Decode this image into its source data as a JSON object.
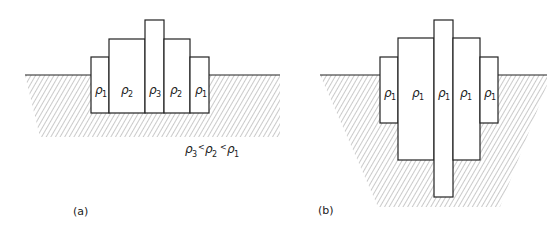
{
  "figure": {
    "panels": [
      {
        "caption": "(a)",
        "blocks": [
          {
            "symbol": "ρ",
            "subscript": "1"
          },
          {
            "symbol": "ρ",
            "subscript": "2"
          },
          {
            "symbol": "ρ",
            "subscript": "3"
          },
          {
            "symbol": "ρ",
            "subscript": "2"
          },
          {
            "symbol": "ρ",
            "subscript": "1"
          }
        ],
        "relation": {
          "parts": [
            {
              "symbol": "ρ",
              "subscript": "3"
            },
            {
              "op": "<"
            },
            {
              "symbol": "ρ",
              "subscript": "2"
            },
            {
              "op": "<"
            },
            {
              "symbol": "ρ",
              "subscript": "1"
            }
          ]
        }
      },
      {
        "caption": "(b)",
        "blocks": [
          {
            "symbol": "ρ",
            "subscript": "1"
          },
          {
            "symbol": "ρ",
            "subscript": "1"
          },
          {
            "symbol": "ρ",
            "subscript": "1"
          },
          {
            "symbol": "ρ",
            "subscript": "1"
          },
          {
            "symbol": "ρ",
            "subscript": "1"
          }
        ]
      }
    ],
    "colors": {
      "line": "#222222",
      "hatch": "#8a8a8a",
      "background": "#ffffff"
    }
  }
}
